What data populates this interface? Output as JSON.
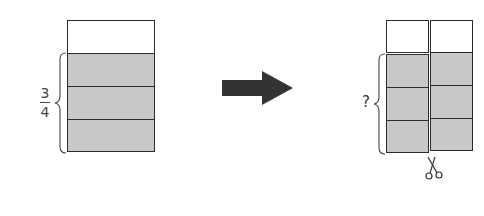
{
  "left_figure": {
    "fraction_label": {
      "numerator": "3",
      "denominator": "4"
    },
    "parts_total": 4,
    "parts_shaded": 3
  },
  "arrow": {
    "direction": "right",
    "color": "#333333"
  },
  "right_figure": {
    "question_label": "?",
    "columns": 2,
    "parts_per_column": 4,
    "parts_shaded_per_column": 3,
    "cut_icon": "scissors-icon"
  },
  "colors": {
    "shaded_fill": "#c8c8c8",
    "outline": "#2b2b2b",
    "background": "#ffffff"
  }
}
